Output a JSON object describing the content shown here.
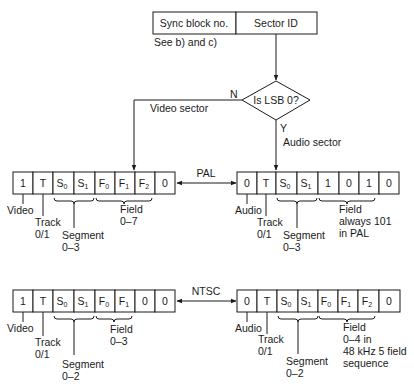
{
  "header": {
    "sync_block": "Sync block no.",
    "sector_id": "Sector ID",
    "note": "See b) and c)"
  },
  "decision": {
    "question": "Is LSB 0?",
    "no": "N",
    "yes": "Y",
    "no_branch": "Video sector",
    "yes_branch": "Audio sector"
  },
  "pal": {
    "label": "PAL",
    "video": {
      "cells": [
        "1",
        "T",
        "S",
        "S",
        "F",
        "F",
        "F",
        "0"
      ],
      "subs": [
        "",
        "",
        "0",
        "1",
        "0",
        "1",
        "2",
        ""
      ],
      "labels": {
        "type": "Video",
        "track": "Track",
        "track_range": "0/1",
        "segment": "Segment",
        "segment_range": "0–3",
        "field": "Field",
        "field_range": "0–7"
      }
    },
    "audio": {
      "cells": [
        "0",
        "T",
        "S",
        "S",
        "1",
        "0",
        "1",
        "0"
      ],
      "subs": [
        "",
        "",
        "0",
        "1",
        "",
        "",
        "",
        ""
      ],
      "labels": {
        "type": "Audio",
        "track": "Track",
        "track_range": "0/1",
        "segment": "Segment",
        "segment_range": "0–3",
        "field": "Field",
        "field_line2": "always 101",
        "field_line3": "in PAL"
      }
    }
  },
  "ntsc": {
    "label": "NTSC",
    "video": {
      "cells": [
        "1",
        "T",
        "S",
        "S",
        "F",
        "F",
        "0",
        "0"
      ],
      "subs": [
        "",
        "",
        "0",
        "1",
        "0",
        "1",
        "",
        ""
      ],
      "labels": {
        "type": "Video",
        "track": "Track",
        "track_range": "0/1",
        "segment": "Segment",
        "segment_range": "0–2",
        "field": "Field",
        "field_range": "0–3"
      }
    },
    "audio": {
      "cells": [
        "0",
        "T",
        "S",
        "S",
        "F",
        "F",
        "F",
        "0"
      ],
      "subs": [
        "",
        "",
        "0",
        "1",
        "0",
        "1",
        "2",
        ""
      ],
      "labels": {
        "type": "Audio",
        "track": "Track",
        "track_range": "0/1",
        "segment": "Segment",
        "segment_range": "0–2",
        "field": "Field",
        "field_line2": "0–4 in",
        "field_line3": "48 kHz 5 field",
        "field_line4": "sequence"
      }
    }
  }
}
